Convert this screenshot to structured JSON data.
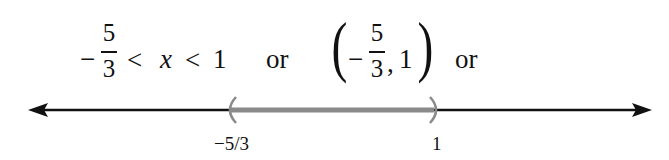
{
  "inequality": {
    "minus": "−",
    "frac_num": "5",
    "frac_den": "3",
    "lt1": "<",
    "var": "x",
    "lt2": "<",
    "upper": "1"
  },
  "connector_1": "or",
  "interval": {
    "open_paren": "(",
    "minus": "−",
    "frac_num": "5",
    "frac_den": "3",
    "comma": ",",
    "upper": "1",
    "close_paren": ")"
  },
  "connector_2": "or",
  "number_line": {
    "left_endpoint_label": "−5/3",
    "right_endpoint_label": "1",
    "left_endpoint_type": "open",
    "right_endpoint_type": "open",
    "line_color": "#111111",
    "segment_color": "#8a8a8a"
  }
}
